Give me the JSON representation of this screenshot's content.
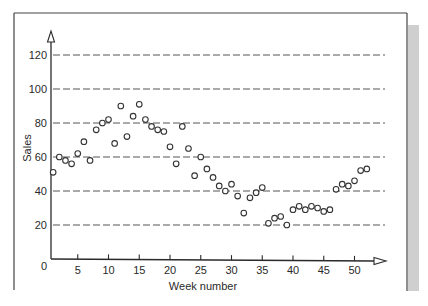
{
  "chart_data": {
    "type": "scatter",
    "title": "",
    "xlabel": "Week number",
    "ylabel": "Sales",
    "xlim": [
      0,
      55
    ],
    "ylim": [
      0,
      128
    ],
    "x_ticks": [
      5,
      10,
      15,
      20,
      25,
      30,
      35,
      40,
      45,
      50
    ],
    "y_ticks": [
      20,
      40,
      60,
      80,
      100,
      120
    ],
    "origin_label": "0",
    "grid": "horizontal dashed at y ticks",
    "legend": null,
    "marker": "open circle",
    "series": [
      {
        "name": "Sales",
        "x": [
          1,
          2,
          3,
          4,
          5,
          6,
          7,
          8,
          9,
          10,
          11,
          12,
          13,
          14,
          15,
          16,
          17,
          18,
          19,
          20,
          21,
          22,
          23,
          24,
          25,
          26,
          27,
          28,
          29,
          30,
          31,
          32,
          33,
          34,
          35,
          36,
          37,
          38,
          39,
          40,
          41,
          42,
          43,
          44,
          45,
          46,
          47,
          48,
          49,
          50,
          51,
          52
        ],
        "values": [
          51,
          60,
          58,
          56,
          62,
          69,
          58,
          76,
          80,
          82,
          68,
          90,
          72,
          84,
          91,
          82,
          78,
          76,
          75,
          66,
          56,
          78,
          65,
          49,
          60,
          53,
          48,
          43,
          40,
          44,
          37,
          27,
          36,
          39,
          42,
          21,
          24,
          25,
          20,
          29,
          31,
          29,
          31,
          30,
          28,
          29,
          41,
          44,
          43,
          46,
          52,
          53
        ]
      }
    ]
  },
  "colors": {
    "axis": "#2a2a2a",
    "grid": "#555555",
    "marker_stroke": "#333333",
    "frame": "#444444",
    "side_stripe": "#cfcfcf"
  }
}
